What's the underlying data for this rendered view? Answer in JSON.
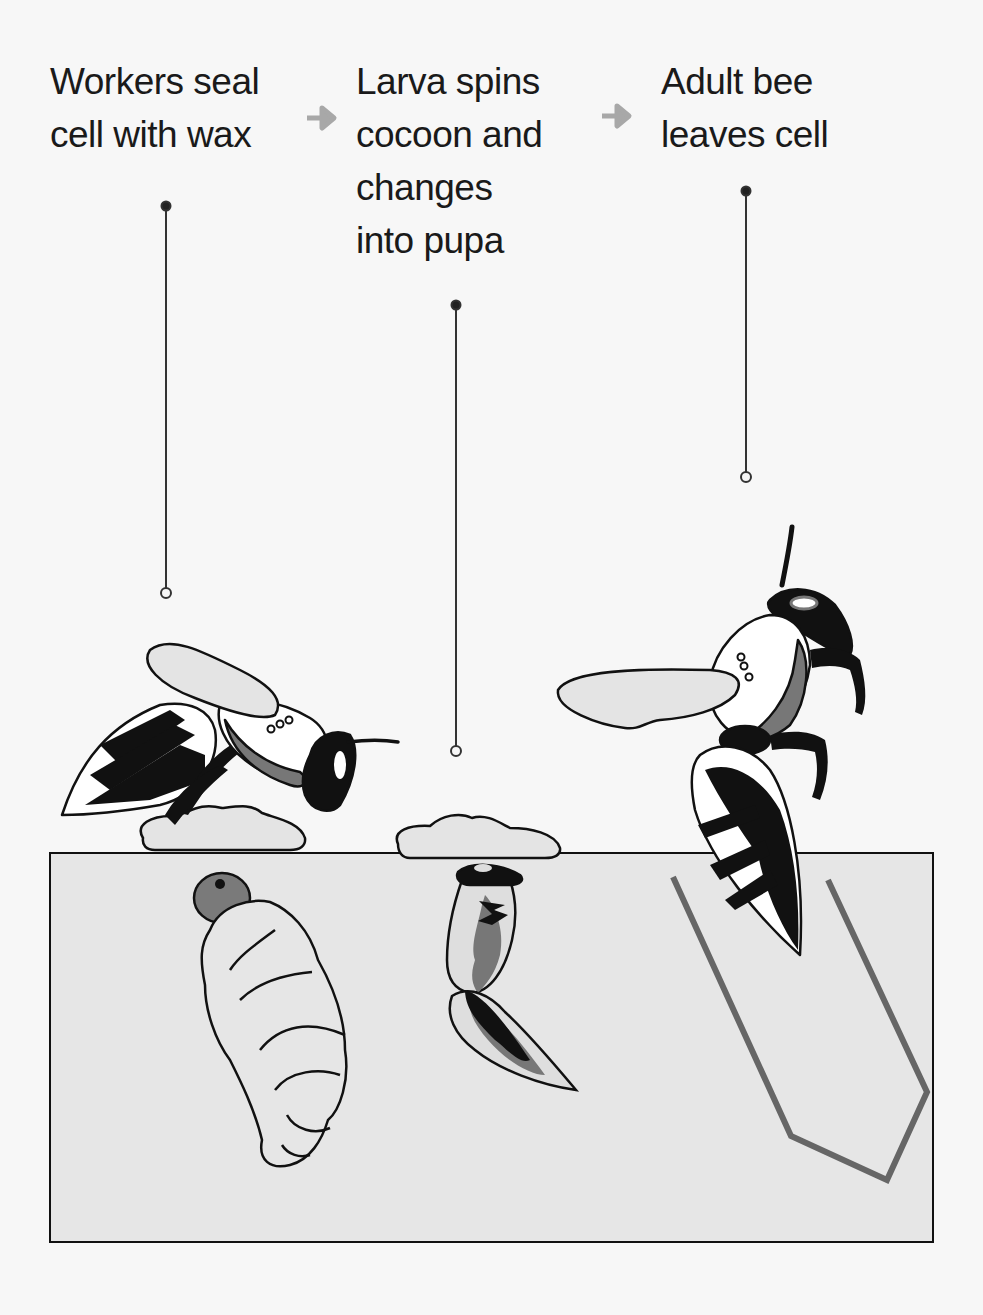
{
  "stages": [
    {
      "id": "seal",
      "lines": [
        "Workers seal",
        "cell with wax"
      ]
    },
    {
      "id": "pupa",
      "lines": [
        "Larva spins",
        "cocoon and",
        "changes",
        "into pupa"
      ]
    },
    {
      "id": "adult",
      "lines": [
        "Adult bee",
        "leaves cell"
      ]
    }
  ],
  "arrows": [
    "arrow-1",
    "arrow-2"
  ],
  "colors": {
    "background": "#f7f7f7",
    "cell_fill": "#e6e6e6",
    "outline": "#111111",
    "wax": "#e4e4e4",
    "mid_gray": "#707070",
    "arrow": "#a8a8a8",
    "cell_wall": "#666666"
  }
}
